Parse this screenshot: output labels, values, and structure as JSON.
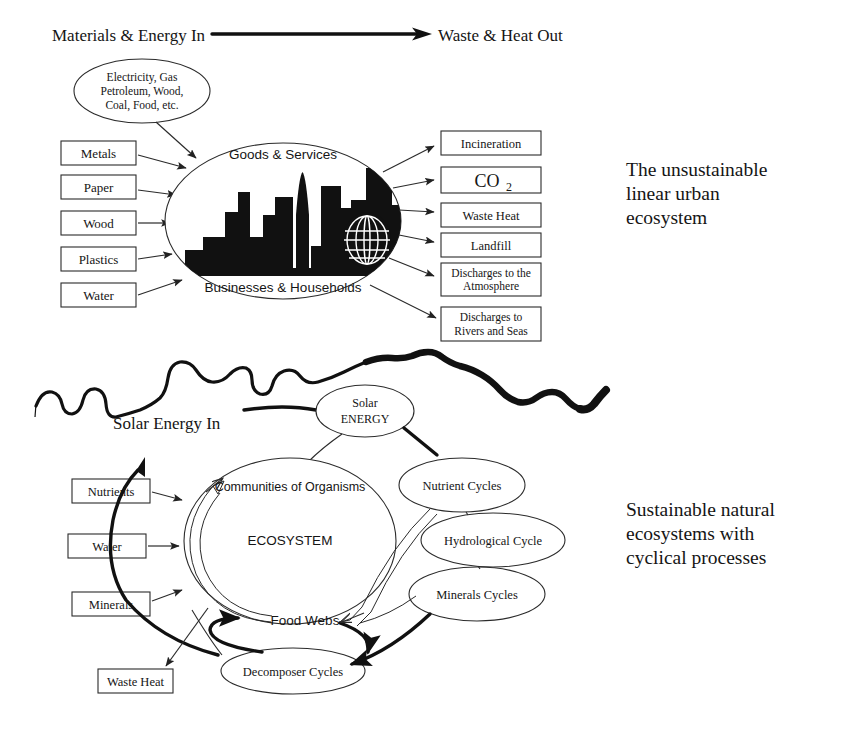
{
  "figure": {
    "title_top_left": "Materials & Energy In",
    "title_top_right": "Waste & Heat Out",
    "caption_upper": [
      "The unsustainable",
      "linear urban",
      "ecosystem"
    ],
    "caption_lower": [
      "Sustainable natural",
      "ecosystems with",
      "cyclical processes"
    ]
  },
  "upper": {
    "source_ellipse": [
      "Electricity, Gas",
      "Petroleum, Wood,",
      "Coal, Food, etc."
    ],
    "inputs": [
      {
        "label": "Metals"
      },
      {
        "label": "Paper"
      },
      {
        "label": "Wood"
      },
      {
        "label": "Plastics"
      },
      {
        "label": "Water"
      }
    ],
    "city": {
      "top_label": "Goods & Services",
      "bottom_label": "Businesses & Households"
    },
    "outputs": [
      {
        "label": "Incineration",
        "lines": [
          "Incineration"
        ]
      },
      {
        "label": "CO2",
        "lines": [
          "CO"
        ],
        "subscript": "2"
      },
      {
        "label": "Waste Heat",
        "lines": [
          "Waste Heat"
        ]
      },
      {
        "label": "Landfill",
        "lines": [
          "Landfill"
        ]
      },
      {
        "label": "Discharges to the Atmosphere",
        "lines": [
          "Discharges to the",
          "Atmosphere"
        ]
      },
      {
        "label": "Discharges to Rivers and Seas",
        "lines": [
          "Discharges to",
          "Rivers and Seas"
        ]
      }
    ]
  },
  "lower": {
    "solar_in_label": "Solar Energy In",
    "solar_ellipse": [
      "Solar",
      "ENERGY"
    ],
    "inputs": [
      {
        "label": "Nutrients"
      },
      {
        "label": "Water"
      },
      {
        "label": "Minerals"
      }
    ],
    "waste_heat_box": "Waste Heat",
    "ecosystem": {
      "top_label": "Communities of Organisms",
      "center_label": "ECOSYSTEM",
      "bottom_label": "Food Webs"
    },
    "decomposer_label": "Decomposer Cycles",
    "cycles": [
      {
        "label": "Nutrient Cycles"
      },
      {
        "label": "Hydrological Cycle"
      },
      {
        "label": "Minerals Cycles"
      }
    ]
  },
  "colors": {
    "ink": "#151515",
    "stroke": "#2b2b2b",
    "fill": "#ffffff",
    "building": "#111111"
  }
}
